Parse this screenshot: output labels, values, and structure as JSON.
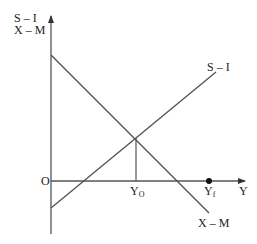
{
  "diagram": {
    "y_axis_label_line1": "S – I",
    "y_axis_label_line2": "X – M",
    "x_axis_label": "Y",
    "origin_label": "O",
    "curve_s_i_label": "S – I",
    "curve_x_m_label": "X – M",
    "y0_label_main": "Y",
    "y0_label_sub": "O",
    "yf_label_main": "Y",
    "yf_label_sub": "f",
    "colors": {
      "lines": "#555555",
      "text": "#222222"
    }
  }
}
